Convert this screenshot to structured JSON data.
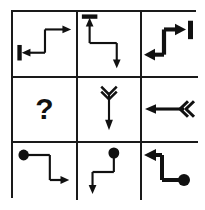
{
  "puzzle": {
    "type": "matrix-reasoning",
    "rows": 3,
    "columns": 3,
    "background_color": "#ffffff",
    "ink_color": "#111111",
    "border_color": "#1a1a1a",
    "missing_cell_label": "?",
    "cells": [
      {
        "index": 1,
        "row": 1,
        "column": 1,
        "name": "cell-r1c1",
        "description": "thin elbow path with bar tail at left and arrowhead pointing right at top",
        "stroke_weight": "thin",
        "tail_marker": "vertical-bar",
        "head_direction": "right",
        "second_head_direction": "left",
        "alt": "Thin path: arrowhead points left into a vertical bar at lower left; path rises and points right with an arrowhead at upper right."
      },
      {
        "index": 2,
        "row": 1,
        "column": 2,
        "name": "cell-r1c2",
        "description": "thin path with horizontal bar tail at top and arrowhead pointing down at bottom right",
        "stroke_weight": "thin",
        "tail_marker": "horizontal-bar",
        "head_direction": "down",
        "second_head_direction": "up",
        "alt": "Thin path: arrowhead points up into a horizontal bar at top left; path descends right and ends with a downward arrowhead."
      },
      {
        "index": 3,
        "row": 1,
        "column": 3,
        "name": "cell-r1c3",
        "description": "thick path with vertical bar at right and arrowhead pointing left at bottom",
        "stroke_weight": "thick",
        "tail_marker": "vertical-bar",
        "head_direction": "left",
        "second_head_direction": "right",
        "alt": "Thick path: arrowhead points right into a vertical bar at upper right; path drops and ends pointing left with an arrowhead."
      },
      {
        "index": 4,
        "row": 2,
        "column": 1,
        "name": "cell-r2c1-missing",
        "description": "missing element shown as a question mark",
        "stroke_weight": "none",
        "tail_marker": "none",
        "head_direction": "none",
        "alt": "Empty cell containing a bold question mark."
      },
      {
        "index": 5,
        "row": 2,
        "column": 2,
        "name": "cell-r2c2",
        "description": "straight vertical arrow pointing down with double chevron fletching at top",
        "stroke_weight": "thin",
        "tail_marker": "double-chevron",
        "head_direction": "down",
        "alt": "Straight thin arrow pointing down with a double chevron tail at the top."
      },
      {
        "index": 6,
        "row": 2,
        "column": 3,
        "name": "cell-r2c3",
        "description": "straight horizontal arrow pointing left with double chevron fletching at right",
        "stroke_weight": "thick",
        "tail_marker": "double-chevron",
        "head_direction": "left",
        "alt": "Straight thick arrow pointing left with a double chevron tail at the right."
      },
      {
        "index": 7,
        "row": 3,
        "column": 1,
        "name": "cell-r3c1",
        "description": "thin path starting at a filled circle at upper left, ending with arrowhead pointing right",
        "stroke_weight": "thin",
        "tail_marker": "filled-circle",
        "head_direction": "right",
        "alt": "Thin path starting at a filled dot at upper left, stepping down and right, ending with a right arrowhead."
      },
      {
        "index": 8,
        "row": 3,
        "column": 2,
        "name": "cell-r3c2",
        "description": "thin path starting at a filled circle at upper right, ending with arrowhead pointing down",
        "stroke_weight": "thin",
        "tail_marker": "filled-circle",
        "head_direction": "down",
        "alt": "Thin path starting at a filled dot at upper right, stepping left and down, ending with a downward arrowhead."
      },
      {
        "index": 9,
        "row": 3,
        "column": 3,
        "name": "cell-r3c3",
        "description": "thick path starting at a filled circle at lower right, ending with arrowhead pointing left",
        "stroke_weight": "thick",
        "tail_marker": "filled-circle",
        "head_direction": "left",
        "alt": "Thick path starting at a filled dot at lower right, stepping up and left, ending with a left arrowhead."
      }
    ]
  }
}
